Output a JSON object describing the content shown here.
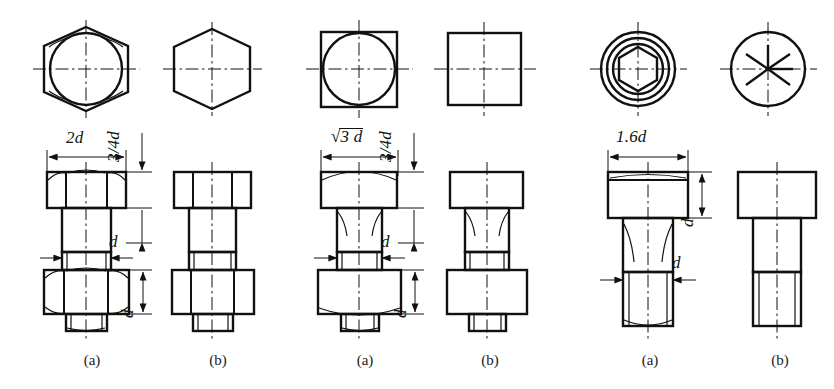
{
  "figure": {
    "background_color": "#ffffff",
    "line_color": "#111111",
    "width": 834,
    "height": 389
  },
  "groups": [
    {
      "id": "hex-bolt",
      "name": "Hexagon head bolt",
      "top_view_a": "hexagon-with-inscribed-circle",
      "top_view_b": "plain-hexagon",
      "dimensions": [
        {
          "key": "width_across",
          "text": "2d",
          "orientation": "horizontal"
        },
        {
          "key": "head_height",
          "text": "3/4d",
          "orientation": "vertical"
        },
        {
          "key": "shank_dia",
          "text": "d",
          "orientation": "horizontal"
        },
        {
          "key": "nut_height",
          "text": "d",
          "orientation": "vertical"
        }
      ],
      "captions": [
        {
          "label": "(a)",
          "x": 92
        },
        {
          "label": "(b)",
          "x": 218
        }
      ]
    },
    {
      "id": "square-bolt",
      "name": "Square head bolt",
      "top_view_a": "square-with-inscribed-circle",
      "top_view_b": "plain-square",
      "dimensions": [
        {
          "key": "width_across",
          "text": "3 d",
          "prefix": "radical",
          "orientation": "horizontal"
        },
        {
          "key": "head_height",
          "text": "3/4d",
          "orientation": "vertical"
        },
        {
          "key": "shank_dia",
          "text": "d",
          "orientation": "horizontal"
        },
        {
          "key": "nut_height",
          "text": "d",
          "orientation": "vertical"
        }
      ],
      "captions": [
        {
          "label": "(a)",
          "x": 365
        },
        {
          "label": "(b)",
          "x": 490
        }
      ]
    },
    {
      "id": "socket-screw",
      "name": "Socket head cap screw",
      "top_view_a": "concentric-circles-with-hex-socket",
      "top_view_b": "circle-with-six-spoke-star",
      "dimensions": [
        {
          "key": "head_dia",
          "text": "1.6d",
          "orientation": "horizontal"
        },
        {
          "key": "head_height",
          "text": "d",
          "orientation": "vertical"
        },
        {
          "key": "shank_dia",
          "text": "d",
          "orientation": "horizontal"
        }
      ],
      "captions": [
        {
          "label": "(a)",
          "x": 650
        },
        {
          "label": "(b)",
          "x": 780
        }
      ]
    }
  ],
  "labels": {
    "hex_2d": "2d",
    "hex_34d": "3/4d",
    "hex_d_shank": "d",
    "hex_d_nut": "d",
    "sq_root3d": "3 d",
    "sq_34d": "3/4d",
    "sq_d_shank": "d",
    "sq_d_nut": "d",
    "sock_16d": "1.6d",
    "sock_d_head": "d",
    "sock_d_shank": "d"
  },
  "captions": {
    "a1": "(a)",
    "b1": "(b)",
    "a2": "(a)",
    "b2": "(b)",
    "a3": "(a)",
    "b3": "(b)"
  }
}
